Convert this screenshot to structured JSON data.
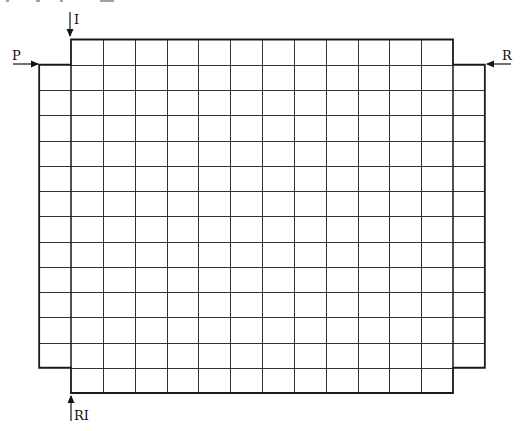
{
  "diagram": {
    "type": "grid-layout",
    "main_grid": {
      "columns": 12,
      "rows": 14
    },
    "side_extensions": {
      "left": {
        "columns": 1,
        "rows": 12,
        "start_row": 2
      },
      "right": {
        "columns": 1,
        "rows": 12,
        "start_row": 2
      }
    },
    "labels": {
      "top": "I",
      "left": "P",
      "right": "R",
      "bottom": "RI"
    },
    "arrows": [
      {
        "label": "I",
        "direction": "down",
        "position": "top-left corner of main grid"
      },
      {
        "label": "P",
        "direction": "right",
        "position": "top of left extension"
      },
      {
        "label": "R",
        "direction": "left",
        "position": "top of right extension"
      },
      {
        "label": "RI",
        "direction": "up",
        "position": "bottom-left corner of main grid"
      }
    ],
    "colors": {
      "line": "#1a1a1a",
      "inner_line": "#333333",
      "background": "#ffffff"
    }
  }
}
